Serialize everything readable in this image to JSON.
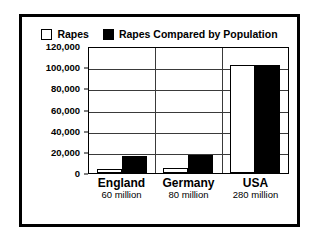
{
  "chart_data": {
    "type": "bar",
    "title": "",
    "subtitle": "",
    "xlabel": "",
    "ylabel": "",
    "ylim": [
      0,
      120000
    ],
    "ytick_labels": [
      "120,000",
      "100,000",
      "80,000",
      "60,000",
      "40,000",
      "20,000",
      "0"
    ],
    "ytick_values": [
      120000,
      100000,
      80000,
      60000,
      40000,
      20000,
      0
    ],
    "grid": true,
    "legend_position": "top-center",
    "categories": [
      "England",
      "Germany",
      "USA"
    ],
    "category_sublabels": [
      "60 million",
      "80 million",
      "280 million"
    ],
    "series": [
      {
        "name": "Rapes",
        "color": "#ffffff",
        "edge_color": "#000000",
        "values": [
          4000,
          5000,
          102000
        ]
      },
      {
        "name": "Rapes Compared by Population",
        "color": "#000000",
        "edge_color": "#000000",
        "values": [
          16000,
          17000,
          102000
        ]
      }
    ]
  },
  "legend": {
    "entries": [
      {
        "label": "Rapes",
        "swatch": "hollow-square-icon"
      },
      {
        "label": "Rapes Compared by Population",
        "swatch": "filled-square-icon"
      }
    ]
  },
  "colors": {
    "frame": "#000000",
    "background": "#ffffff",
    "grid": "#3a3a3a",
    "series_a": "#ffffff",
    "series_b": "#000000"
  }
}
